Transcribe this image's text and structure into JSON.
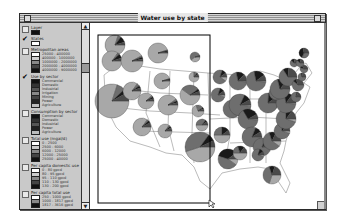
{
  "window": {
    "title": "Water use by state"
  },
  "legend": {
    "layers": [
      {
        "name": "Layer",
        "checked": false,
        "classes": [
          {
            "label": "",
            "color": "#111111"
          }
        ]
      },
      {
        "name": "States",
        "checked": true,
        "classes": [
          {
            "label": "",
            "color": "#ffffff"
          }
        ]
      },
      {
        "name": "Metropolitan areas",
        "checked": false,
        "classes": [
          {
            "label": "25000 - 400000",
            "color": "#ffffff"
          },
          {
            "label": "400000 - 1000000",
            "color": "#d0d0d0"
          },
          {
            "label": "1000000 - 2000000",
            "color": "#888888"
          },
          {
            "label": "2000000 - 4000000",
            "color": "#444444"
          },
          {
            "label": "4000000 - 9000000",
            "color": "#111111"
          }
        ]
      },
      {
        "name": "Use by sector",
        "checked": true,
        "classes": [
          {
            "label": "Commercial",
            "color": "#111111"
          },
          {
            "label": "Domestic",
            "color": "#333333"
          },
          {
            "label": "Industrial",
            "color": "#555555"
          },
          {
            "label": "Irrigation",
            "color": "#888888"
          },
          {
            "label": "Mining",
            "color": "#444444"
          },
          {
            "label": "Power",
            "color": "#222222"
          },
          {
            "label": "Agriculture",
            "color": "#bbbbbb"
          }
        ]
      },
      {
        "name": "Consumption by sector",
        "checked": false,
        "classes": [
          {
            "label": "Commercial",
            "color": "#111111"
          },
          {
            "label": "Domestic",
            "color": "#333333"
          },
          {
            "label": "Industrial",
            "color": "#555555"
          },
          {
            "label": "Power",
            "color": "#222222"
          },
          {
            "label": "Agriculture",
            "color": "#bbbbbb"
          }
        ]
      },
      {
        "name": "Total use (mgal/d)",
        "checked": false,
        "classes": [
          {
            "label": "0 - 2500",
            "color": "#ffffff"
          },
          {
            "label": "2500 - 6000",
            "color": "#cccccc"
          },
          {
            "label": "6000 - 12000",
            "color": "#888888"
          },
          {
            "label": "12000 - 25000",
            "color": "#444444"
          },
          {
            "label": "25000 - 40000",
            "color": "#111111"
          }
        ]
      },
      {
        "name": "Per capita domestic use",
        "checked": false,
        "classes": [
          {
            "label": "0 - 80 gpcd",
            "color": "#ffffff"
          },
          {
            "label": "80 - 95 gpcd",
            "color": "#cccccc"
          },
          {
            "label": "95 - 110 gpcd",
            "color": "#888888"
          },
          {
            "label": "110 - 130 gpcd",
            "color": "#444444"
          },
          {
            "label": "130 - 200 gpcd",
            "color": "#111111"
          }
        ]
      },
      {
        "name": "Per capita total use",
        "checked": false,
        "classes": [
          {
            "label": "250 - 1000 gpcd",
            "color": "#ffffff"
          },
          {
            "label": "1000 - 1817 gpcd",
            "color": "#888888"
          },
          {
            "label": "1817 - 3616 gpcd",
            "color": "#111111"
          }
        ]
      }
    ]
  },
  "scrollbar": {
    "up_arrow": "▲",
    "down_arrow": "▼"
  },
  "map": {
    "pie_colors": {
      "irrigation": "#a8a8a8",
      "power": "#6e6e6e",
      "industrial": "#1a1a1a",
      "domestic": "#4a4a4a"
    },
    "pies": [
      {
        "state": "WA",
        "shares": [
          0.8,
          0.05,
          0.1,
          0.05
        ]
      },
      {
        "state": "OR",
        "shares": [
          0.85,
          0.03,
          0.07,
          0.05
        ]
      },
      {
        "state": "CA",
        "shares": [
          0.8,
          0.08,
          0.04,
          0.08
        ]
      },
      {
        "state": "ID",
        "shares": [
          0.92,
          0.02,
          0.03,
          0.03
        ]
      },
      {
        "state": "MT",
        "shares": [
          0.95,
          0.01,
          0.02,
          0.02
        ]
      },
      {
        "state": "WY",
        "shares": [
          0.95,
          0.01,
          0.02,
          0.02
        ]
      },
      {
        "state": "NV",
        "shares": [
          0.85,
          0.05,
          0.04,
          0.06
        ]
      },
      {
        "state": "UT",
        "shares": [
          0.88,
          0.03,
          0.04,
          0.05
        ]
      },
      {
        "state": "CO",
        "shares": [
          0.9,
          0.03,
          0.03,
          0.04
        ]
      },
      {
        "state": "AZ",
        "shares": [
          0.85,
          0.03,
          0.04,
          0.08
        ]
      },
      {
        "state": "NM",
        "shares": [
          0.85,
          0.03,
          0.04,
          0.08
        ]
      },
      {
        "state": "ND",
        "shares": [
          0.4,
          0.55,
          0.02,
          0.03
        ]
      },
      {
        "state": "SD",
        "shares": [
          0.75,
          0.1,
          0.05,
          0.1
        ]
      },
      {
        "state": "NE",
        "shares": [
          0.6,
          0.3,
          0.04,
          0.06
        ]
      },
      {
        "state": "KS",
        "shares": [
          0.7,
          0.2,
          0.04,
          0.06
        ]
      },
      {
        "state": "OK",
        "shares": [
          0.5,
          0.35,
          0.05,
          0.1
        ]
      },
      {
        "state": "TX",
        "shares": [
          0.45,
          0.4,
          0.08,
          0.07
        ]
      },
      {
        "state": "MN",
        "shares": [
          0.1,
          0.7,
          0.1,
          0.1
        ]
      },
      {
        "state": "IA",
        "shares": [
          0.05,
          0.75,
          0.1,
          0.1
        ]
      },
      {
        "state": "MO",
        "shares": [
          0.1,
          0.75,
          0.05,
          0.1
        ]
      },
      {
        "state": "AR",
        "shares": [
          0.5,
          0.25,
          0.15,
          0.1
        ]
      },
      {
        "state": "LA",
        "shares": [
          0.1,
          0.45,
          0.35,
          0.1
        ]
      },
      {
        "state": "WI",
        "shares": [
          0.02,
          0.7,
          0.15,
          0.13
        ]
      },
      {
        "state": "IL",
        "shares": [
          0.02,
          0.8,
          0.1,
          0.08
        ]
      },
      {
        "state": "MI",
        "shares": [
          0.02,
          0.7,
          0.18,
          0.1
        ]
      },
      {
        "state": "IN",
        "shares": [
          0.02,
          0.65,
          0.25,
          0.08
        ]
      },
      {
        "state": "OH",
        "shares": [
          0.01,
          0.75,
          0.14,
          0.1
        ]
      },
      {
        "state": "KY",
        "shares": [
          0.01,
          0.8,
          0.1,
          0.09
        ]
      },
      {
        "state": "TN",
        "shares": [
          0.01,
          0.8,
          0.1,
          0.09
        ]
      },
      {
        "state": "MS",
        "shares": [
          0.5,
          0.2,
          0.15,
          0.15
        ]
      },
      {
        "state": "AL",
        "shares": [
          0.05,
          0.75,
          0.1,
          0.1
        ]
      },
      {
        "state": "GA",
        "shares": [
          0.1,
          0.6,
          0.12,
          0.18
        ]
      },
      {
        "state": "FL",
        "shares": [
          0.3,
          0.4,
          0.1,
          0.2
        ]
      },
      {
        "state": "SC",
        "shares": [
          0.05,
          0.7,
          0.12,
          0.13
        ]
      },
      {
        "state": "NC",
        "shares": [
          0.05,
          0.7,
          0.1,
          0.15
        ]
      },
      {
        "state": "VA",
        "shares": [
          0.02,
          0.7,
          0.13,
          0.15
        ]
      },
      {
        "state": "WV",
        "shares": [
          0.01,
          0.85,
          0.08,
          0.06
        ]
      },
      {
        "state": "PA",
        "shares": [
          0.01,
          0.7,
          0.15,
          0.14
        ]
      },
      {
        "state": "NY",
        "shares": [
          0.01,
          0.65,
          0.1,
          0.24
        ]
      },
      {
        "state": "NJ",
        "shares": [
          0.02,
          0.6,
          0.08,
          0.3
        ]
      },
      {
        "state": "MD",
        "shares": [
          0.02,
          0.75,
          0.05,
          0.18
        ]
      },
      {
        "state": "CT",
        "shares": [
          0.01,
          0.7,
          0.05,
          0.24
        ]
      },
      {
        "state": "MA",
        "shares": [
          0.01,
          0.55,
          0.1,
          0.34
        ]
      },
      {
        "state": "VT",
        "shares": [
          0.02,
          0.6,
          0.15,
          0.23
        ]
      },
      {
        "state": "NH",
        "shares": [
          0.02,
          0.6,
          0.15,
          0.23
        ]
      },
      {
        "state": "ME",
        "shares": [
          0.02,
          0.3,
          0.4,
          0.28
        ]
      }
    ]
  }
}
